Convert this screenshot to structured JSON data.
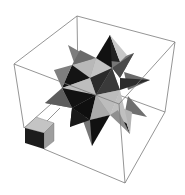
{
  "figure": {
    "background": "#ffffff",
    "box_stroke": "#6e6e6e",
    "colors": {
      "light": "#bdbdbd",
      "mid": "#8a8a8a",
      "dark": "#5a5a5a",
      "black": "#141414",
      "cube_top": "#c4c4c4",
      "cube_side": "#9e9e9e",
      "cube_front": "#1c1c1c"
    }
  }
}
